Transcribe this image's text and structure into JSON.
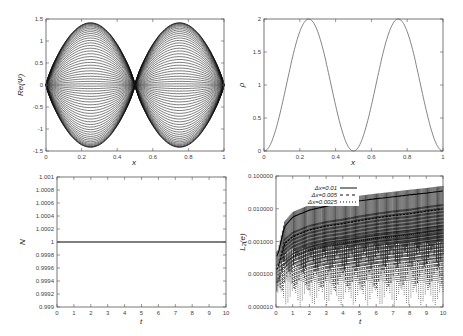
{
  "chart_data": [
    {
      "id": "re_psi",
      "type": "line",
      "title": "",
      "xlabel": "x",
      "ylabel": "Re(Ψ)",
      "xlim": [
        0,
        1
      ],
      "ylim": [
        -1.5,
        1.5
      ],
      "xticks": [
        "0",
        "0.2",
        "0.4",
        "0.6",
        "0.8",
        "1"
      ],
      "yticks": [
        "-1.5",
        "-1",
        "-0.5",
        "0",
        "0.5",
        "1",
        "1.5"
      ],
      "grid": false,
      "description": "Family of ~60 curves Re(Ψ)=A·sin(2πx) style envelopes; amplitudes spread between -1.41 and 1.41 with peaks at x=0.25 and x=0.75, nodes at x=0, 0.5, 1",
      "envelope_amplitude": 1.414,
      "curve_count": 60
    },
    {
      "id": "rho",
      "type": "line",
      "title": "",
      "xlabel": "x",
      "ylabel": "ρ",
      "xlim": [
        0,
        1
      ],
      "ylim": [
        0,
        2
      ],
      "xticks": [
        "0",
        "0.2",
        "0.4",
        "0.6",
        "0.8",
        "1"
      ],
      "yticks": [
        "0",
        "0.5",
        "1",
        "1.5",
        "2"
      ],
      "grid": false,
      "series": [
        {
          "name": "rho",
          "x": [
            0,
            0.05,
            0.1,
            0.15,
            0.2,
            0.25,
            0.3,
            0.35,
            0.4,
            0.45,
            0.5,
            0.55,
            0.6,
            0.65,
            0.7,
            0.75,
            0.8,
            0.85,
            0.9,
            0.95,
            1.0
          ],
          "values": [
            0,
            0.19,
            0.69,
            1.31,
            1.81,
            2.0,
            1.81,
            1.31,
            0.69,
            0.19,
            0,
            0.19,
            0.69,
            1.31,
            1.81,
            2.0,
            1.81,
            1.31,
            0.69,
            0.19,
            0
          ]
        }
      ]
    },
    {
      "id": "norm",
      "type": "line",
      "title": "",
      "xlabel": "t",
      "ylabel": "N",
      "xlim": [
        0,
        10
      ],
      "ylim": [
        0.999,
        1.001
      ],
      "xticks": [
        "0",
        "1",
        "2",
        "3",
        "4",
        "5",
        "6",
        "7",
        "8",
        "9",
        "10"
      ],
      "yticks": [
        "0.999",
        "0.9992",
        "0.9994",
        "0.9996",
        "0.9998",
        "1",
        "1.0002",
        "1.0004",
        "1.0006",
        "1.0008",
        "1.001"
      ],
      "grid": false,
      "series": [
        {
          "name": "N",
          "x": [
            0,
            10
          ],
          "values": [
            1,
            1
          ]
        }
      ]
    },
    {
      "id": "l2_error",
      "type": "line",
      "title": "",
      "xlabel": "t",
      "ylabel": "L₂(e)",
      "xlim": [
        0,
        10
      ],
      "ylim": [
        1e-05,
        0.1
      ],
      "yscale": "log",
      "xticks": [
        "0",
        "1",
        "2",
        "3",
        "4",
        "5",
        "6",
        "7",
        "8",
        "9",
        "10"
      ],
      "yticks": [
        "0.000010",
        "0.000100",
        "0.001000",
        "0.010000",
        "0.100000"
      ],
      "grid": false,
      "legend_position": "upper left",
      "legend": [
        "Δx=0.01",
        "Δx=0.005",
        "Δx=0.0025"
      ],
      "series": [
        {
          "name": "Δx=0.01",
          "style": "solid",
          "x": [
            0.1,
            0.5,
            1,
            2,
            3,
            4,
            5,
            6,
            7,
            8,
            9,
            10
          ],
          "upper": [
            0.0005,
            0.004,
            0.008,
            0.013,
            0.017,
            0.021,
            0.025,
            0.029,
            0.033,
            0.038,
            0.043,
            0.05
          ],
          "lower": [
            3e-05,
            8e-05,
            0.0001,
            0.0001,
            0.00012,
            0.00012,
            0.00013,
            0.00014,
            0.00014,
            0.00015,
            0.00015,
            0.00016
          ]
        },
        {
          "name": "Δx=0.005",
          "style": "dashed",
          "x": [
            0.1,
            0.5,
            1,
            2,
            3,
            4,
            5,
            6,
            7,
            8,
            9,
            10
          ],
          "upper": [
            0.0002,
            0.0012,
            0.002,
            0.0032,
            0.0042,
            0.005,
            0.0062,
            0.0075,
            0.0088,
            0.01,
            0.012,
            0.014
          ],
          "lower": [
            2e-05,
            3e-05,
            3e-05,
            3e-05,
            3e-05,
            3e-05,
            3e-05,
            3e-05,
            4e-05,
            4e-05,
            4e-05,
            4e-05
          ]
        },
        {
          "name": "Δx=0.0025",
          "style": "dotted",
          "x": [
            0.1,
            0.5,
            1,
            2,
            3,
            4,
            5,
            6,
            7,
            8,
            9,
            10
          ],
          "upper": [
            8e-05,
            0.0003,
            0.0005,
            0.0008,
            0.0011,
            0.0013,
            0.0015,
            0.0018,
            0.002,
            0.0023,
            0.0027,
            0.0032
          ],
          "lower": [
            1e-05,
            1e-05,
            1e-05,
            1e-05,
            1e-05,
            1e-05,
            1e-05,
            1e-05,
            1e-05,
            1e-05,
            1e-05,
            1e-05
          ]
        }
      ]
    }
  ],
  "panels": {
    "tl": {
      "xlabel": "x",
      "ylabel": "Re(Ψ)"
    },
    "tr": {
      "xlabel": "x",
      "ylabel": "ρ"
    },
    "bl": {
      "xlabel": "t",
      "ylabel": "N"
    },
    "br": {
      "xlabel": "t",
      "ylabel": "L₂(e)",
      "legend": [
        "Δx=0.01",
        "Δx=0.005",
        "Δx=0.0025"
      ]
    }
  }
}
